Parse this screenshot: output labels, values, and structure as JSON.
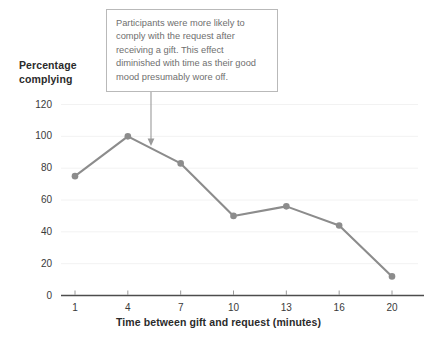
{
  "chart_data": {
    "type": "line",
    "title": "",
    "xlabel": "Time between gift and request (minutes)",
    "ylabel": "Percentage complying",
    "categories": [
      "1",
      "4",
      "7",
      "10",
      "13",
      "16",
      "20"
    ],
    "values": [
      75,
      100,
      83,
      50,
      56,
      44,
      12
    ],
    "series": [
      {
        "name": "Percentage complying",
        "values": [
          75,
          100,
          83,
          50,
          56,
          44,
          12
        ]
      }
    ],
    "ylim": [
      0,
      120
    ],
    "yticks": [
      "0",
      "20",
      "40",
      "60",
      "80",
      "100",
      "120"
    ],
    "ytick_values": [
      0,
      20,
      40,
      60,
      80,
      100,
      120
    ],
    "xticks": [
      "1",
      "4",
      "7",
      "10",
      "13",
      "16",
      "20"
    ],
    "grid": "horizontal",
    "legend": "none",
    "annotations": [
      {
        "text": "Participants were more likely to comply with the request after receiving a gift. This effect diminished with time as their good mood presumably wore off.",
        "arrow_target_x": "5.5",
        "arrow_target_y": "94"
      }
    ],
    "colors": {
      "line": "#8c8c8c",
      "marker": "#8c8c8c",
      "grid": "#f2f2f2",
      "axis": "#4d4d4d",
      "annotation_border": "#b9b9b9",
      "annotation_text": "#6f6f6f",
      "label_text": "#3a3a3a",
      "title_text": "#2b2b2b",
      "background": "#ffffff"
    }
  },
  "axis": {
    "y_title_line1": "Percentage",
    "y_title_line2": "complying"
  }
}
